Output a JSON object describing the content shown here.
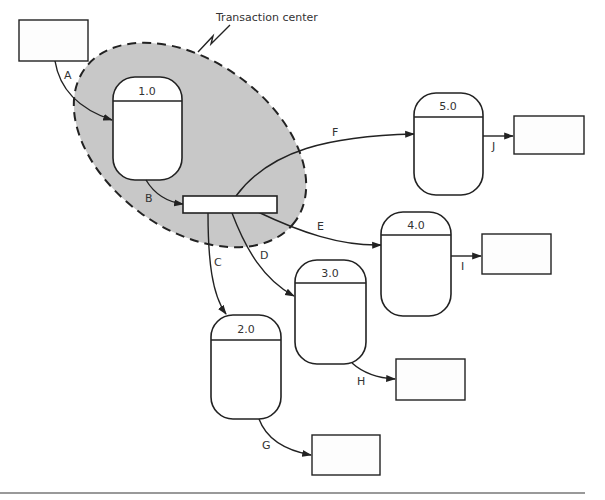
{
  "diagram": {
    "type": "data-flow-diagram",
    "annotation": {
      "label": "Transaction center"
    },
    "colors": {
      "transaction_center_fill": "#c8c8c8",
      "stroke": "#222222",
      "divider_line": "#888888"
    },
    "processes": [
      {
        "id": "1.0",
        "label": "1.0"
      },
      {
        "id": "2.0",
        "label": "2.0"
      },
      {
        "id": "3.0",
        "label": "3.0"
      },
      {
        "id": "4.0",
        "label": "4.0"
      },
      {
        "id": "5.0",
        "label": "5.0"
      }
    ],
    "external_entities": [
      {
        "id": "source",
        "label": ""
      },
      {
        "id": "sink-g",
        "label": ""
      },
      {
        "id": "sink-h",
        "label": ""
      },
      {
        "id": "sink-i",
        "label": ""
      },
      {
        "id": "sink-j",
        "label": ""
      }
    ],
    "transaction_store": {
      "label": ""
    },
    "flows": [
      {
        "label": "A",
        "from": "source",
        "to": "1.0"
      },
      {
        "label": "B",
        "from": "1.0",
        "to": "transaction"
      },
      {
        "label": "C",
        "from": "transaction",
        "to": "2.0"
      },
      {
        "label": "D",
        "from": "transaction",
        "to": "3.0"
      },
      {
        "label": "E",
        "from": "transaction",
        "to": "4.0"
      },
      {
        "label": "F",
        "from": "transaction",
        "to": "5.0"
      },
      {
        "label": "G",
        "from": "2.0",
        "to": "sink-g"
      },
      {
        "label": "H",
        "from": "3.0",
        "to": "sink-h"
      },
      {
        "label": "I",
        "from": "4.0",
        "to": "sink-i"
      },
      {
        "label": "J",
        "from": "5.0",
        "to": "sink-j"
      }
    ]
  }
}
